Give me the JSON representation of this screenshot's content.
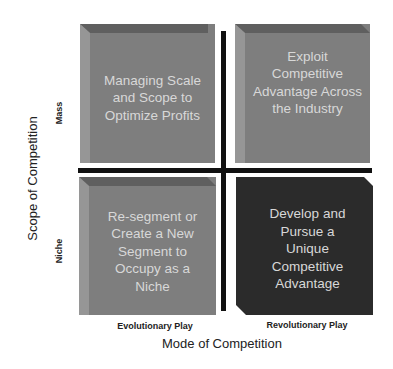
{
  "diagram": {
    "type": "2x2 matrix",
    "x_axis": {
      "title": "Mode of Competition",
      "categories": [
        "Evolutionary Play",
        "Revolutionary Play"
      ]
    },
    "y_axis": {
      "title": "Scope of Competition",
      "categories": [
        "Mass",
        "Niche"
      ]
    },
    "quadrants": [
      {
        "position": "top-left",
        "text": "Managing Scale and Scope to Optimize Profits",
        "lines": [
          "Managing Scale",
          "and Scope to",
          "Optimize Profits"
        ]
      },
      {
        "position": "top-right",
        "text": "Exploit Competitive Advantage Across the Industry",
        "lines": [
          "Exploit",
          "Competitive",
          "Advantage Across",
          "the Industry"
        ]
      },
      {
        "position": "bottom-left",
        "text": "Re-segment or Create a New Segment to Occupy as a Niche",
        "lines": [
          "Re-segment or",
          "Create a New",
          "Segment to",
          "Occupy as a",
          "Niche"
        ]
      },
      {
        "position": "bottom-right",
        "text": "Develop and Pursue a Unique Competitive Advantage",
        "lines": [
          "Develop and",
          "Pursue a",
          "Unique",
          "Competitive",
          "Advantage"
        ]
      }
    ]
  },
  "colors": {
    "box_light": "#7e7e7e",
    "box_light_bevel_top": "#5f5f5f",
    "box_light_bevel_left": "#959595",
    "box_dark": "#2b2b2b",
    "divider": "#111111",
    "box_text": "#d8d8d8"
  }
}
